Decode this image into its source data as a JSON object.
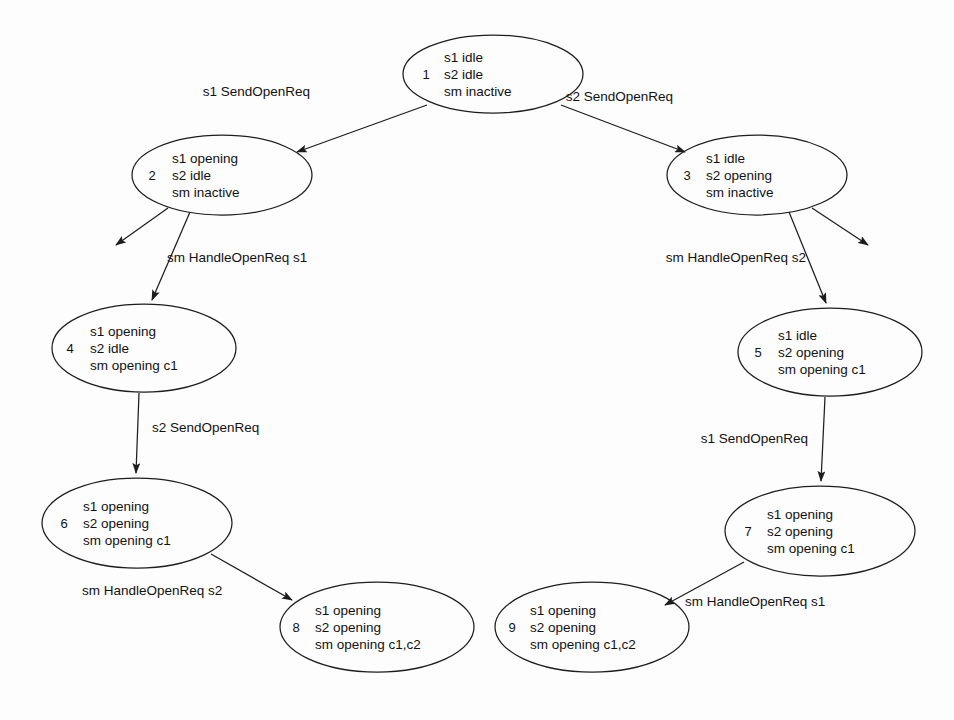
{
  "diagram": {
    "type": "state-transition-graph",
    "background_color": "#fdfdfd",
    "stroke_color": "#1d1d1d",
    "text_color": "#111111",
    "nodes": [
      {
        "id": "1",
        "lines": [
          "s1 idle",
          "s2 idle",
          "sm inactive"
        ],
        "cx": 493,
        "cy": 74,
        "rx": 90,
        "ry": 39,
        "id_x": 426,
        "text_x": 444
      },
      {
        "id": "2",
        "lines": [
          "s1 opening",
          "s2 idle",
          "sm inactive"
        ],
        "cx": 222,
        "cy": 175,
        "rx": 90,
        "ry": 40,
        "id_x": 152,
        "text_x": 172
      },
      {
        "id": "3",
        "lines": [
          "s1 idle",
          "s2 opening",
          "sm inactive"
        ],
        "cx": 757,
        "cy": 175,
        "rx": 90,
        "ry": 40,
        "id_x": 687,
        "text_x": 706
      },
      {
        "id": "4",
        "lines": [
          "s1 opening",
          "s2 idle",
          "sm opening c1"
        ],
        "cx": 144,
        "cy": 348,
        "rx": 92,
        "ry": 44,
        "id_x": 70,
        "text_x": 90
      },
      {
        "id": "5",
        "lines": [
          "s1 idle",
          "s2 opening",
          "sm opening c1"
        ],
        "cx": 830,
        "cy": 352,
        "rx": 92,
        "ry": 44,
        "id_x": 758,
        "text_x": 778
      },
      {
        "id": "6",
        "lines": [
          "s1 opening",
          "s2 opening",
          "sm opening c1"
        ],
        "cx": 137,
        "cy": 523,
        "rx": 95,
        "ry": 45,
        "id_x": 64,
        "text_x": 83
      },
      {
        "id": "7",
        "lines": [
          "s1 opening",
          "s2 opening",
          "sm opening c1"
        ],
        "cx": 820,
        "cy": 531,
        "rx": 95,
        "ry": 45,
        "id_x": 748,
        "text_x": 767
      },
      {
        "id": "8",
        "lines": [
          "s1 opening",
          "s2 opening",
          "sm opening c1,c2"
        ],
        "cx": 377,
        "cy": 627,
        "rx": 97,
        "ry": 45,
        "id_x": 296,
        "text_x": 315
      },
      {
        "id": "9",
        "lines": [
          "s1 opening",
          "s2 opening",
          "sm opening c1,c2"
        ],
        "cx": 592,
        "cy": 627,
        "rx": 97,
        "ry": 45,
        "id_x": 512,
        "text_x": 530
      }
    ],
    "edges": [
      {
        "name": "edge-1-to-2",
        "from": "1",
        "to": "2",
        "label": "s1 SendOpenReq",
        "path": "M 427 105 L 297 152",
        "label_x": 310,
        "label_y": 96,
        "label_anchor": "end"
      },
      {
        "name": "edge-1-to-3",
        "from": "1",
        "to": "3",
        "label": "s2 SendOpenReq",
        "path": "M 561 105 L 685 152",
        "label_x": 673,
        "label_y": 101,
        "label_anchor": "end"
      },
      {
        "name": "edge-2-dangling-left",
        "from": "2",
        "to": "",
        "label": "",
        "path": "M 168 208 L 116 245",
        "label_x": 0,
        "label_y": 0,
        "label_anchor": "middle"
      },
      {
        "name": "edge-2-to-4",
        "from": "2",
        "to": "4",
        "label": "sm HandleOpenReq s1",
        "path": "M 190 212 L 152 300",
        "label_x": 167,
        "label_y": 262,
        "label_anchor": "start"
      },
      {
        "name": "edge-3-dangling-right",
        "from": "3",
        "to": "",
        "label": "",
        "path": "M 812 208 L 868 245",
        "label_x": 0,
        "label_y": 0,
        "label_anchor": "middle"
      },
      {
        "name": "edge-3-to-5",
        "from": "3",
        "to": "5",
        "label": "sm HandleOpenReq s2",
        "path": "M 789 212 L 826 303",
        "label_x": 806,
        "label_y": 262,
        "label_anchor": "end"
      },
      {
        "name": "edge-4-to-6",
        "from": "4",
        "to": "6",
        "label": "s2 SendOpenReq",
        "path": "M 139 393 L 136 473",
        "label_x": 152,
        "label_y": 432,
        "label_anchor": "start"
      },
      {
        "name": "edge-5-to-7",
        "from": "5",
        "to": "7",
        "label": "s1 SendOpenReq",
        "path": "M 825 397 L 821 481",
        "label_x": 808,
        "label_y": 443,
        "label_anchor": "end"
      },
      {
        "name": "edge-6-to-8",
        "from": "6",
        "to": "8",
        "label": "sm HandleOpenReq s2",
        "path": "M 211 554 L 292 600",
        "label_x": 82,
        "label_y": 595,
        "label_anchor": "start"
      },
      {
        "name": "edge-7-to-9",
        "from": "7",
        "to": "9",
        "label": "sm HandleOpenReq s1",
        "path": "M 744 562 L 665 605",
        "label_x": 685,
        "label_y": 606,
        "label_anchor": "start"
      }
    ]
  }
}
